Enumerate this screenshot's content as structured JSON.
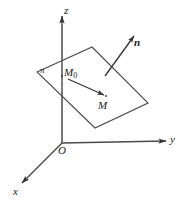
{
  "figure": {
    "background_color": "#ffffff",
    "stroke_color": "#3c3c3c",
    "axis_color": "#4a4a4a",
    "width": 186,
    "height": 202
  },
  "axes": {
    "z": {
      "label": "z",
      "arrow": "up"
    },
    "y": {
      "label": "y",
      "arrow": "right"
    },
    "x": {
      "label": "x",
      "arrow": "down-left"
    },
    "origin": {
      "label": "O"
    }
  },
  "plane": {
    "label": "π",
    "shape": "parallelogram"
  },
  "points": {
    "m0": {
      "label": "M",
      "subscript": "0"
    },
    "m": {
      "label": "M"
    }
  },
  "vectors": {
    "normal": {
      "label": "n",
      "style": "bold-italic"
    },
    "m0_to_m": {
      "label": ""
    }
  }
}
